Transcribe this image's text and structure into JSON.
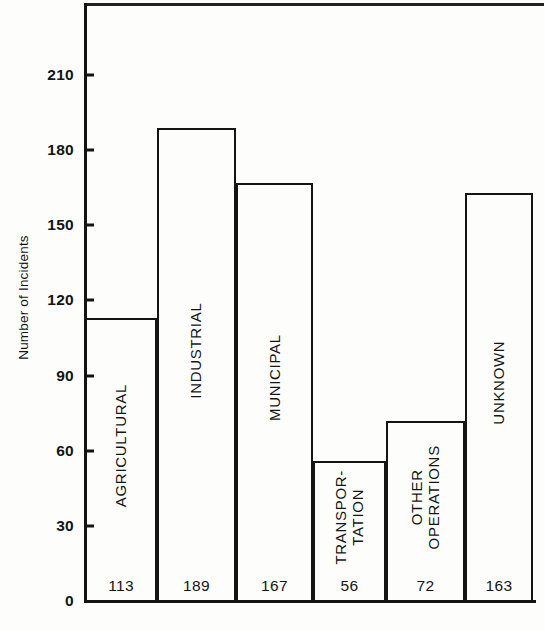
{
  "chart_data": {
    "type": "bar",
    "title": "",
    "xlabel": "",
    "ylabel": "Number of Incidents",
    "categories": [
      "AGRICULTURAL",
      "INDUSTRIAL",
      "MUNICIPAL",
      "TRANSPOR- TATION",
      "OTHER OPERATIONS",
      "UNKNOWN"
    ],
    "values": [
      113,
      189,
      167,
      56,
      72,
      163
    ],
    "ylim": [
      0,
      225
    ],
    "yticks": [
      0,
      30,
      60,
      90,
      120,
      150,
      180,
      210
    ],
    "ytick_labels": [
      "0",
      "30",
      "60",
      "90",
      "120",
      "150",
      "180",
      "210"
    ],
    "grid": false,
    "legend": null,
    "value_labels": [
      "113",
      "189",
      "167",
      "56",
      "72",
      "163"
    ],
    "bar_fill": "#ffffff",
    "bar_stroke": "#141414",
    "background": "#ffffff"
  },
  "bars": [
    {
      "id": "agricultural",
      "value": 113,
      "value_label": "113",
      "label_lines": [
        "AGRICULTURAL"
      ]
    },
    {
      "id": "industrial",
      "value": 189,
      "value_label": "189",
      "label_lines": [
        "INDUSTRIAL"
      ]
    },
    {
      "id": "municipal",
      "value": 167,
      "value_label": "167",
      "label_lines": [
        "MUNICIPAL"
      ]
    },
    {
      "id": "transportation",
      "value": 56,
      "value_label": "56",
      "label_lines": [
        "TRANSPOR-",
        "TATION"
      ]
    },
    {
      "id": "other-operations",
      "value": 72,
      "value_label": "72",
      "label_lines": [
        "OTHER",
        "OPERATIONS"
      ]
    },
    {
      "id": "unknown",
      "value": 163,
      "value_label": "163",
      "label_lines": [
        "UNKNOWN"
      ]
    }
  ],
  "yaxis": {
    "title": "Number of Incidents",
    "ticks": [
      {
        "value": 210,
        "label": "210"
      },
      {
        "value": 180,
        "label": "180"
      },
      {
        "value": 150,
        "label": "150"
      },
      {
        "value": 120,
        "label": "120"
      },
      {
        "value": 90,
        "label": "90"
      },
      {
        "value": 60,
        "label": "60"
      },
      {
        "value": 30,
        "label": "30"
      },
      {
        "value": 0,
        "label": "0"
      }
    ]
  }
}
